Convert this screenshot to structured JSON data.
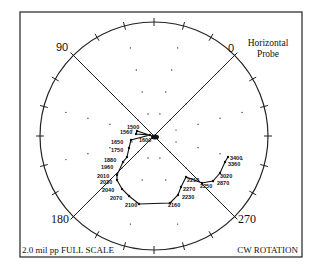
{
  "chart_data": {
    "type": "scatter",
    "subtype": "polar",
    "title": "Horizontal Probe",
    "title_lines": [
      "Horizontal",
      "Probe"
    ],
    "scale_label": "2.0 mil pp FULL SCALE",
    "rotation_label": "CW ROTATION",
    "full_scale_mil_pp": 2.0,
    "angle_labels": [
      {
        "label": "0",
        "position": "upper-right"
      },
      {
        "label": "90",
        "position": "upper-left"
      },
      {
        "label": "180",
        "position": "lower-left"
      },
      {
        "label": "270",
        "position": "lower-right"
      }
    ],
    "grid": {
      "type": "dotted-rings",
      "rings": 4,
      "spoke_interval_deg": 30
    },
    "tick_interval_deg": 15,
    "series": [
      {
        "name": "Vibration vector vs speed (rpm)",
        "points": [
          {
            "rpm": 1500,
            "x": 137,
            "y": 131
          },
          {
            "rpm": 1560,
            "x": 136,
            "y": 134
          },
          {
            "rpm": 1600,
            "x": 150,
            "y": 135
          },
          {
            "rpm": 1650,
            "x": 131,
            "y": 140
          },
          {
            "rpm": 1750,
            "x": 129,
            "y": 148
          },
          {
            "rpm": 1880,
            "x": 127,
            "y": 157
          },
          {
            "rpm": 1960,
            "x": 123,
            "y": 162
          },
          {
            "rpm": 2010,
            "x": 117,
            "y": 175
          },
          {
            "rpm": 2030,
            "x": 117,
            "y": 180
          },
          {
            "rpm": 2040,
            "x": 122,
            "y": 189
          },
          {
            "rpm": 2070,
            "x": 129,
            "y": 196
          },
          {
            "rpm": 2100,
            "x": 139,
            "y": 204
          },
          {
            "rpm": 2160,
            "x": 170,
            "y": 203
          },
          {
            "rpm": 2230,
            "x": 178,
            "y": 195
          },
          {
            "rpm": 2270,
            "x": 181,
            "y": 187
          },
          {
            "rpm": 2210,
            "x": 186,
            "y": 177
          },
          {
            "rpm": 2250,
            "x": 202,
            "y": 183
          },
          {
            "rpm": 2870,
            "x": 213,
            "y": 181
          },
          {
            "rpm": 3020,
            "x": 220,
            "y": 173
          },
          {
            "rpm": 3360,
            "x": 225,
            "y": 162
          },
          {
            "rpm": 3400,
            "x": 228,
            "y": 157
          }
        ]
      }
    ]
  },
  "labels": {
    "title1": "Horizontal",
    "title2": "Probe",
    "scale": "2.0 mil pp FULL SCALE",
    "rotation": "CW ROTATION",
    "a0": "0",
    "a90": "90",
    "a180": "180",
    "a270": "270",
    "rpm": [
      "1500",
      "1560",
      "1600",
      "1650",
      "1750",
      "1880",
      "1960",
      "2010",
      "2030",
      "2040",
      "2070",
      "2100",
      "2160",
      "2230",
      "2270",
      "2210",
      "2250",
      "2870",
      "3020",
      "3360",
      "3400"
    ]
  }
}
